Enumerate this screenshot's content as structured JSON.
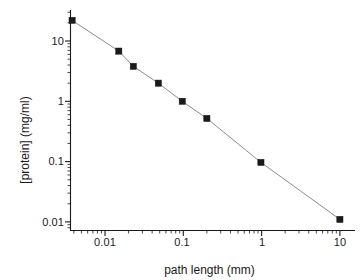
{
  "chart_data": {
    "type": "scatter",
    "title": "",
    "xlabel": "path length (mm)",
    "ylabel": "[protein]  (mg/ml)",
    "xscale": "log",
    "yscale": "log",
    "xlim": [
      0.003,
      13
    ],
    "ylim": [
      0.008,
      30
    ],
    "grid": false,
    "legend": null,
    "marker": "filled-square",
    "marker_color": "#1a1a1a",
    "line_color": "#8c8c8c",
    "series": [
      {
        "name": "protein concentration",
        "x": [
          0.0038,
          0.015,
          0.023,
          0.048,
          0.097,
          0.2,
          0.98,
          10.0
        ],
        "y": [
          22.0,
          6.8,
          3.8,
          2.0,
          1.0,
          0.52,
          0.097,
          0.011
        ]
      }
    ],
    "x_ticks": [
      {
        "value": 0.01,
        "label": "0.01"
      },
      {
        "value": 0.1,
        "label": "0.1"
      },
      {
        "value": 1,
        "label": "1"
      },
      {
        "value": 10,
        "label": "10"
      }
    ],
    "y_ticks": [
      {
        "value": 10,
        "label": "10"
      },
      {
        "value": 1,
        "label": "1"
      },
      {
        "value": 0.1,
        "label": "0.1"
      },
      {
        "value": 0.01,
        "label": "0.01"
      }
    ]
  },
  "axes": {
    "x_title": "path length (mm)",
    "y_title": "[protein]  (mg/ml)",
    "x_tick_labels": [
      "0.01",
      "0.1",
      "1",
      "10"
    ],
    "y_tick_labels": [
      "10",
      "1",
      "0.1",
      "0.01"
    ]
  },
  "colors": {
    "axis": "#1a1a1a",
    "marker": "#1a1a1a",
    "line": "#8c8c8c",
    "background": "#ffffff",
    "text": "#1a1a1a"
  }
}
